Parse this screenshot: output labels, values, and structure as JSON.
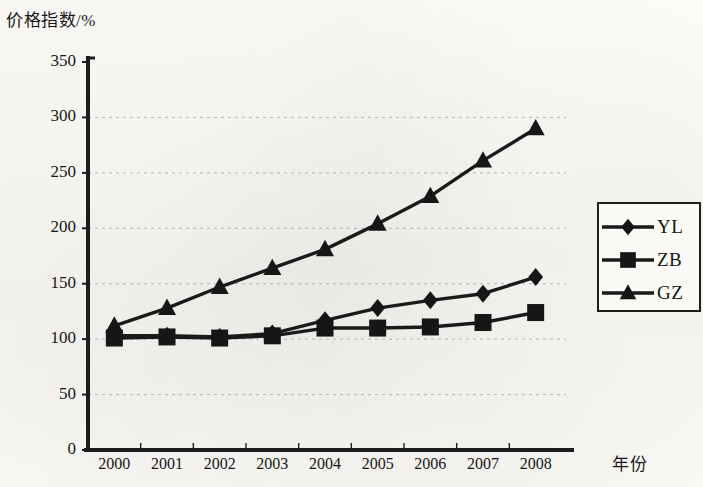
{
  "chart_data": {
    "type": "line",
    "title": "",
    "ylabel": "价格指数/%",
    "xlabel": "年份",
    "categories": [
      "2000",
      "2001",
      "2002",
      "2003",
      "2004",
      "2005",
      "2006",
      "2007",
      "2008"
    ],
    "ylim": [
      0,
      350
    ],
    "ytick_step": 50,
    "yticks": [
      "0",
      "50",
      "100",
      "150",
      "200",
      "250",
      "300",
      "350"
    ],
    "grid": "horizontal-dotted",
    "legend_position": "right",
    "series": [
      {
        "name": "YL",
        "marker": "diamond",
        "color": "#1a1a1a",
        "values": [
          103,
          103,
          102,
          105,
          117,
          128,
          135,
          141,
          156
        ]
      },
      {
        "name": "ZB",
        "marker": "square",
        "color": "#1a1a1a",
        "values": [
          101,
          102,
          101,
          103,
          110,
          110,
          111,
          115,
          124
        ]
      },
      {
        "name": "GZ",
        "marker": "triangle",
        "color": "#1a1a1a",
        "values": [
          112,
          128,
          147,
          164,
          181,
          204,
          229,
          261,
          290
        ]
      }
    ]
  },
  "colors": {
    "axis": "#1d1d1d",
    "gridline": "#9aa3b0",
    "ink": "#161616",
    "paper": "#fbfaf7"
  }
}
